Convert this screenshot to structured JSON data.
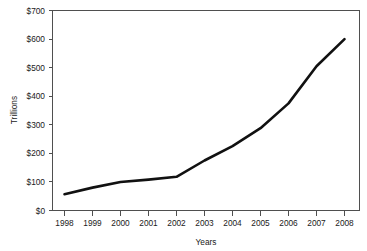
{
  "chart_data": {
    "type": "line",
    "title": "",
    "xlabel": "Years",
    "ylabel": "Trillions",
    "x": [
      1998,
      1999,
      2000,
      2001,
      2002,
      2003,
      2004,
      2005,
      2006,
      2007,
      2008
    ],
    "categories": [
      "1998",
      "1999",
      "2000",
      "2001",
      "2002",
      "2003",
      "2004",
      "2005",
      "2006",
      "2007",
      "2008"
    ],
    "values": [
      57,
      80,
      100,
      108,
      118,
      175,
      225,
      288,
      375,
      505,
      600
    ],
    "series": [
      {
        "name": "Trillions",
        "values": [
          57,
          80,
          100,
          108,
          118,
          175,
          225,
          288,
          375,
          505,
          600
        ]
      }
    ],
    "xlim": [
      1998,
      2008
    ],
    "ylim": [
      0,
      700
    ],
    "ytick_values": [
      0,
      100,
      200,
      300,
      400,
      500,
      600,
      700
    ],
    "ytick_labels": [
      "$0",
      "$100",
      "$200",
      "$300",
      "$400",
      "$500",
      "$600",
      "$700"
    ],
    "xtick_labels": [
      "1998",
      "1999",
      "2000",
      "2001",
      "2002",
      "2003",
      "2004",
      "2005",
      "2006",
      "2007",
      "2008"
    ],
    "grid": false,
    "legend": false,
    "legend_position": "none",
    "line_color": "#111111",
    "frame_color": "#4f4f4f",
    "background_color": "#ffffff"
  }
}
